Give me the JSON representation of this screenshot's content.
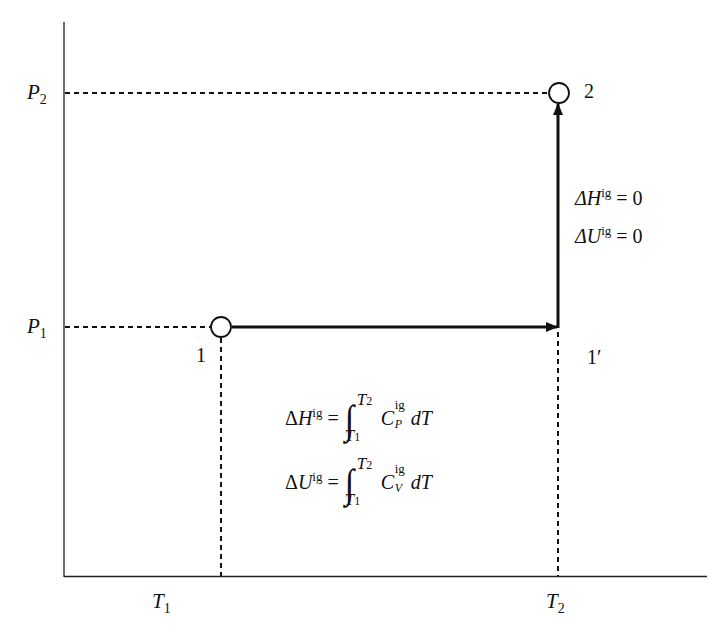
{
  "figure": {
    "type": "P-T path diagram (ideal gas two-step process)",
    "axes": {
      "y_ticks": [
        {
          "label": "P",
          "sub": "2"
        },
        {
          "label": "P",
          "sub": "1"
        }
      ],
      "x_ticks": [
        {
          "label": "T",
          "sub": "1"
        },
        {
          "label": "T",
          "sub": "2"
        }
      ]
    },
    "points": [
      {
        "id": "1",
        "label": "1"
      },
      {
        "id": "1prime",
        "label": "1′"
      },
      {
        "id": "2",
        "label": "2"
      }
    ],
    "step_isobaric": {
      "from": "1",
      "to": "1′",
      "eq_H": {
        "delta": "Δ",
        "var": "H",
        "sup": "ig",
        "rhs": "= ∫ from T1 to T2 of C_P^ig dT",
        "cp": "C",
        "cp_sub": "P",
        "cp_sup": "ig",
        "dt": "dT",
        "lower": "T",
        "lower_sub": "1",
        "upper": "T",
        "upper_sub": "2"
      },
      "eq_U": {
        "delta": "Δ",
        "var": "U",
        "sup": "ig",
        "rhs": "= ∫ from T1 to T2 of C_V^ig dT",
        "cv": "C",
        "cv_sub": "V",
        "cv_sup": "ig",
        "dt": "dT",
        "lower": "T",
        "lower_sub": "1",
        "upper": "T",
        "upper_sub": "2"
      }
    },
    "step_isothermal": {
      "from": "1′",
      "to": "2",
      "eq_H": {
        "text": "ΔH",
        "sup": "ig",
        "rhs": "= 0"
      },
      "eq_U": {
        "text": "ΔU",
        "sup": "ig",
        "rhs": "= 0"
      }
    },
    "glyphs": {
      "equals": "=",
      "integral": "∫"
    }
  }
}
